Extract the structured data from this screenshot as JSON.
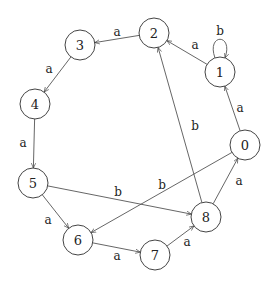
{
  "diagram": {
    "type": "state-automaton",
    "nodes": [
      {
        "id": "0",
        "label": "0",
        "x": 245,
        "y": 145
      },
      {
        "id": "1",
        "label": "1",
        "x": 220,
        "y": 72
      },
      {
        "id": "2",
        "label": "2",
        "x": 154,
        "y": 33
      },
      {
        "id": "3",
        "label": "3",
        "x": 80,
        "y": 45
      },
      {
        "id": "4",
        "label": "4",
        "x": 35,
        "y": 104
      },
      {
        "id": "5",
        "label": "5",
        "x": 33,
        "y": 183
      },
      {
        "id": "6",
        "label": "6",
        "x": 78,
        "y": 240
      },
      {
        "id": "7",
        "label": "7",
        "x": 155,
        "y": 255
      },
      {
        "id": "8",
        "label": "8",
        "x": 206,
        "y": 217
      }
    ],
    "edges": [
      {
        "from": "2",
        "to": "3",
        "label": "a",
        "lx": 117,
        "ly": 32
      },
      {
        "from": "1",
        "to": "2",
        "label": "a",
        "lx": 195,
        "ly": 45
      },
      {
        "from": "1",
        "to": "1",
        "label": "b",
        "lx": 220,
        "ly": 31
      },
      {
        "from": "3",
        "to": "4",
        "label": "a",
        "lx": 49,
        "ly": 69
      },
      {
        "from": "0",
        "to": "1",
        "label": "a",
        "lx": 240,
        "ly": 108
      },
      {
        "from": "4",
        "to": "5",
        "label": "a",
        "lx": 23,
        "ly": 143
      },
      {
        "from": "8",
        "to": "2",
        "label": "b",
        "lx": 195,
        "ly": 126
      },
      {
        "from": "8",
        "to": "0",
        "label": "a",
        "lx": 239,
        "ly": 181
      },
      {
        "from": "5",
        "to": "8",
        "label": "b",
        "lx": 118,
        "ly": 192
      },
      {
        "from": "0",
        "to": "6",
        "label": "b",
        "lx": 162,
        "ly": 185
      },
      {
        "from": "5",
        "to": "6",
        "label": "a",
        "lx": 48,
        "ly": 220
      },
      {
        "from": "6",
        "to": "7",
        "label": "a",
        "lx": 117,
        "ly": 256
      },
      {
        "from": "7",
        "to": "8",
        "label": "a",
        "lx": 187,
        "ly": 242
      }
    ]
  }
}
